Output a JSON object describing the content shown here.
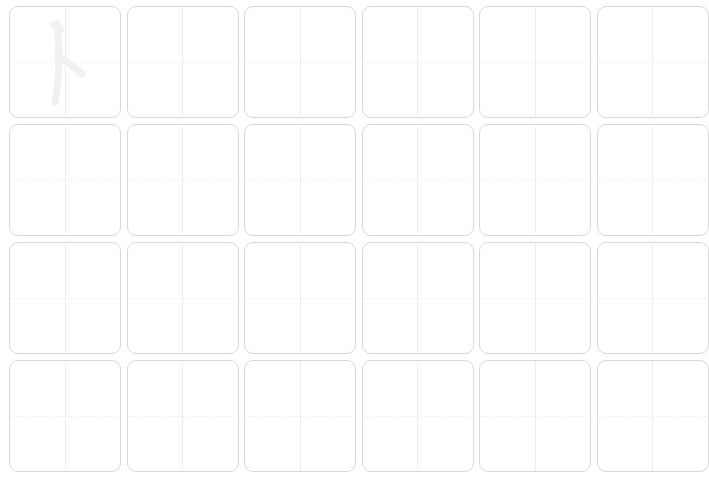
{
  "worksheet": {
    "type": "handwriting-practice-grid",
    "title": "",
    "background_color": "#ffffff",
    "columns": 6,
    "rows": 4,
    "cell_size_px": 112,
    "cell_gap_px": 6,
    "cell_border_color": "#d8d8d8",
    "cell_corner_radius_px": 9,
    "guide_vertical_color": "#ededed",
    "guide_horizontal_color": "#e4e4e4",
    "guide_horizontal_style": "dotted",
    "guide_vertical_style": "solid",
    "stroke_color": "#f1f1f1",
    "cells": [
      {
        "index": 0,
        "row": 1,
        "col": 1,
        "has_stroke": true,
        "stroke_name": "cjk-stroke-ren-radical"
      },
      {
        "index": 1,
        "row": 1,
        "col": 2,
        "has_stroke": false,
        "stroke_name": ""
      },
      {
        "index": 2,
        "row": 1,
        "col": 3,
        "has_stroke": false,
        "stroke_name": ""
      },
      {
        "index": 3,
        "row": 1,
        "col": 4,
        "has_stroke": false,
        "stroke_name": ""
      },
      {
        "index": 4,
        "row": 1,
        "col": 5,
        "has_stroke": false,
        "stroke_name": ""
      },
      {
        "index": 5,
        "row": 1,
        "col": 6,
        "has_stroke": false,
        "stroke_name": ""
      },
      {
        "index": 6,
        "row": 2,
        "col": 1,
        "has_stroke": false,
        "stroke_name": ""
      },
      {
        "index": 7,
        "row": 2,
        "col": 2,
        "has_stroke": false,
        "stroke_name": ""
      },
      {
        "index": 8,
        "row": 2,
        "col": 3,
        "has_stroke": false,
        "stroke_name": ""
      },
      {
        "index": 9,
        "row": 2,
        "col": 4,
        "has_stroke": false,
        "stroke_name": ""
      },
      {
        "index": 10,
        "row": 2,
        "col": 5,
        "has_stroke": false,
        "stroke_name": ""
      },
      {
        "index": 11,
        "row": 2,
        "col": 6,
        "has_stroke": false,
        "stroke_name": ""
      },
      {
        "index": 12,
        "row": 3,
        "col": 1,
        "has_stroke": false,
        "stroke_name": ""
      },
      {
        "index": 13,
        "row": 3,
        "col": 2,
        "has_stroke": false,
        "stroke_name": ""
      },
      {
        "index": 14,
        "row": 3,
        "col": 3,
        "has_stroke": false,
        "stroke_name": ""
      },
      {
        "index": 15,
        "row": 3,
        "col": 4,
        "has_stroke": false,
        "stroke_name": ""
      },
      {
        "index": 16,
        "row": 3,
        "col": 5,
        "has_stroke": false,
        "stroke_name": ""
      },
      {
        "index": 17,
        "row": 3,
        "col": 6,
        "has_stroke": false,
        "stroke_name": ""
      },
      {
        "index": 18,
        "row": 4,
        "col": 1,
        "has_stroke": false,
        "stroke_name": ""
      },
      {
        "index": 19,
        "row": 4,
        "col": 2,
        "has_stroke": false,
        "stroke_name": ""
      },
      {
        "index": 20,
        "row": 4,
        "col": 3,
        "has_stroke": false,
        "stroke_name": ""
      },
      {
        "index": 21,
        "row": 4,
        "col": 4,
        "has_stroke": false,
        "stroke_name": ""
      },
      {
        "index": 22,
        "row": 4,
        "col": 5,
        "has_stroke": false,
        "stroke_name": ""
      },
      {
        "index": 23,
        "row": 4,
        "col": 6,
        "has_stroke": false,
        "stroke_name": ""
      }
    ]
  }
}
